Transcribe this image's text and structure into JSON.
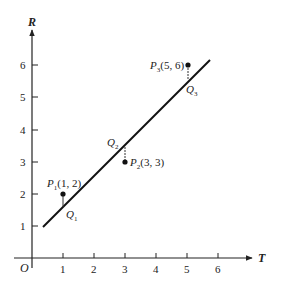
{
  "axes": {
    "x_label": "T",
    "y_label": "R",
    "origin_label": "O",
    "x_ticks": [
      "1",
      "2",
      "3",
      "4",
      "5",
      "6"
    ],
    "y_ticks": [
      "1",
      "2",
      "3",
      "4",
      "5",
      "6"
    ]
  },
  "points": [
    {
      "name": "P",
      "sub": "1",
      "coords": "(1, 2)",
      "x": 1,
      "y": 2
    },
    {
      "name": "P",
      "sub": "2",
      "coords": "(3, 3)",
      "x": 3,
      "y": 3
    },
    {
      "name": "P",
      "sub": "3",
      "coords": "(5, 6)",
      "x": 5,
      "y": 6
    }
  ],
  "projections": [
    {
      "name": "Q",
      "sub": "1"
    },
    {
      "name": "Q",
      "sub": "2"
    },
    {
      "name": "Q",
      "sub": "3"
    }
  ],
  "line": {
    "from": [
      0.4,
      1.0
    ],
    "to": [
      5.7,
      6.2
    ]
  }
}
